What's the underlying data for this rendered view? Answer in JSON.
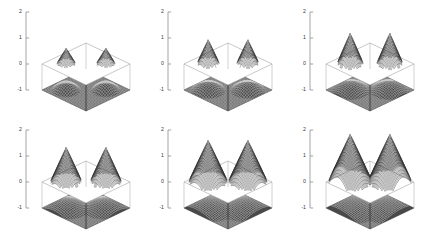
{
  "figure": {
    "title": "",
    "background_color": "#ffffff",
    "layout": {
      "rows": 2,
      "cols": 3,
      "panel_width": 142,
      "panel_height": 118
    }
  },
  "chart_data": {
    "type": "line",
    "title": "",
    "xlabel": "",
    "ylabel": "",
    "subtitle": "Two-peak cone surface at six increasing amplitudes",
    "grid": false,
    "legend_position": "none",
    "axis": {
      "tick_labels": [
        "2",
        "1",
        "0",
        "-1"
      ],
      "tick_values": [
        2,
        1,
        0,
        -1
      ],
      "ylim": [
        -1.4,
        2.2
      ],
      "tick_color": "#808080",
      "label_color": "#3a3a3a"
    },
    "surface": {
      "top_plane_z": 0,
      "bottom_plane_z": -1,
      "top_plane_fill": "#ffffff",
      "top_plane_stroke": "#9a9a9a",
      "bottom_plane_fill": "#4a4a4a",
      "mesh_color": "#2b2b2b",
      "peak_count": 2
    },
    "categories": [
      "panel 1",
      "panel 2",
      "panel 3",
      "panel 4",
      "panel 5",
      "panel 6"
    ],
    "series": [
      {
        "name": "peak height",
        "values": [
          0.62,
          0.95,
          1.2,
          1.35,
          1.62,
          1.85
        ]
      },
      {
        "name": "peak base radius",
        "values": [
          0.3,
          0.36,
          0.42,
          0.5,
          0.62,
          0.7
        ]
      }
    ],
    "panels": [
      {
        "index": 1,
        "peak_height": 0.62,
        "base_radius": 0.3,
        "row": 0,
        "col": 0
      },
      {
        "index": 2,
        "peak_height": 0.95,
        "base_radius": 0.36,
        "row": 0,
        "col": 1
      },
      {
        "index": 3,
        "peak_height": 1.2,
        "base_radius": 0.42,
        "row": 0,
        "col": 2
      },
      {
        "index": 4,
        "peak_height": 1.35,
        "base_radius": 0.5,
        "row": 1,
        "col": 0
      },
      {
        "index": 5,
        "peak_height": 1.62,
        "base_radius": 0.62,
        "row": 1,
        "col": 1
      },
      {
        "index": 6,
        "peak_height": 1.85,
        "base_radius": 0.7,
        "row": 1,
        "col": 2
      }
    ]
  }
}
